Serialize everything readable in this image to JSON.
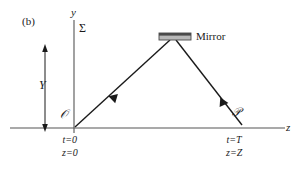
{
  "figure": {
    "panel_label": "(b)",
    "axes": {
      "y_axis_label": "y",
      "z_axis_label": "z",
      "frame_label": "Σ"
    },
    "markers": {
      "height_label": "Y",
      "origin_label": "𝒪",
      "destination_label": "𝒫"
    },
    "mirror": {
      "label": "Mirror",
      "body_color": "#b8b8b8",
      "edge_color": "#4a4a4a"
    },
    "events": [
      {
        "name": "emission",
        "time": "t=0",
        "position": "z=0"
      },
      {
        "name": "reception",
        "time": "t=T",
        "position": "z=Z"
      }
    ],
    "colors": {
      "line": "#1a1a1a",
      "axis": "#555555",
      "background": "#ffffff"
    }
  }
}
